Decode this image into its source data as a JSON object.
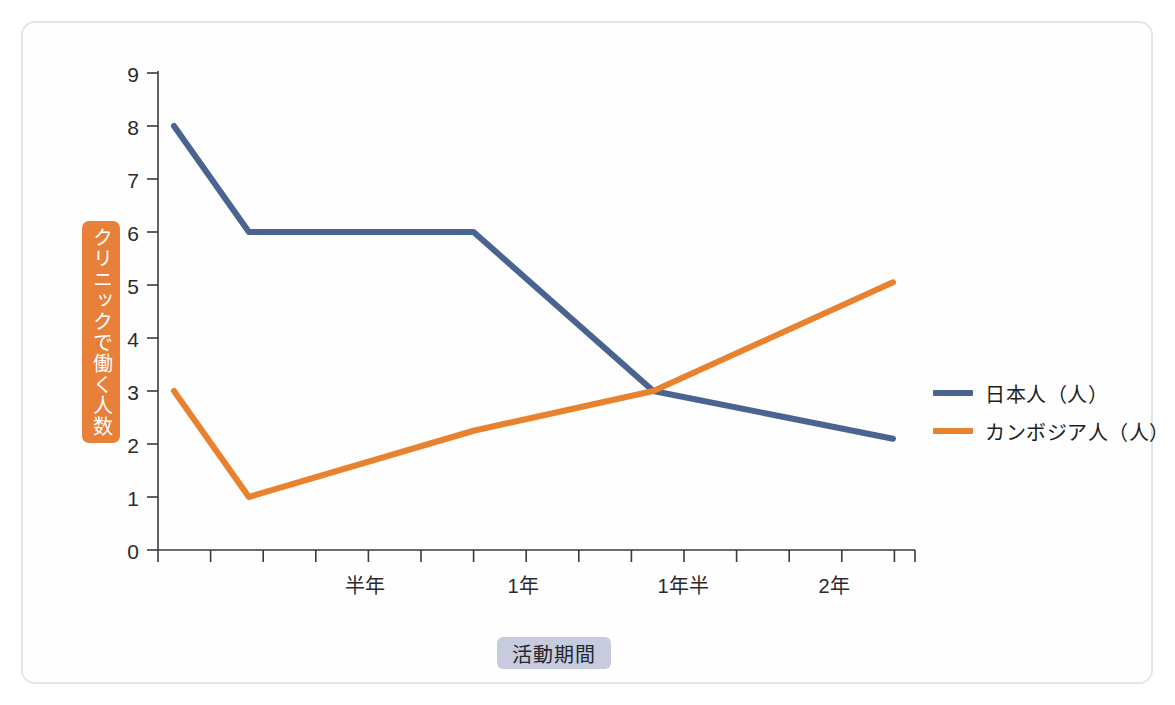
{
  "chart_data": {
    "type": "line",
    "title": "",
    "xlabel": "活動期間",
    "ylabel": "クリニックで働く人数",
    "ylim": [
      0,
      9
    ],
    "yticks": [
      0,
      1,
      2,
      3,
      4,
      5,
      6,
      7,
      8,
      9
    ],
    "ytick_labels": [
      "0",
      "1",
      "2",
      "3",
      "4",
      "5",
      "6",
      "7",
      "8",
      "9"
    ],
    "xtick_labels": [
      "半年",
      "1年",
      "1年半",
      "2年"
    ],
    "x": [
      0,
      0.5,
      2.0,
      3.2,
      4.8
    ],
    "grid": false,
    "legend_position": "right",
    "series": [
      {
        "name": "日本人（人）",
        "color": "#4a6491",
        "values": [
          8,
          6,
          6,
          3,
          2.1
        ]
      },
      {
        "name": "カンボジア人（人）",
        "color": "#e8822e",
        "values": [
          3,
          1,
          2.25,
          3,
          5.05
        ]
      }
    ]
  },
  "axes": {
    "y_title": "クリニックで働く人数",
    "x_title": "活動期間",
    "y_title_bg": "#e8803a",
    "x_title_bg": "#c6cbdd",
    "ytick_labels": [
      "9",
      "8",
      "7",
      "6",
      "5",
      "4",
      "3",
      "2",
      "1",
      "0"
    ],
    "xtick_labels": [
      "半年",
      "1年",
      "1年半",
      "2年"
    ]
  },
  "legend": {
    "items": [
      {
        "label": "日本人（人）",
        "color": "#4a6491"
      },
      {
        "label": "カンボジア人（人）",
        "color": "#e8822e"
      }
    ]
  },
  "colors": {
    "series_blue": "#4a6491",
    "series_orange": "#e8822e",
    "axis": "#3a3a3a",
    "card_border": "#e3e6e8",
    "background": "#ffffff"
  }
}
